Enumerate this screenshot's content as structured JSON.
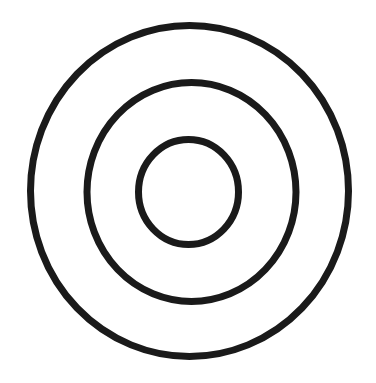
{
  "canvas": {
    "width": 376,
    "height": 383,
    "background": "#ffffff"
  },
  "stroke": {
    "color": "#1a1a1a",
    "width": 7
  },
  "rings": [
    {
      "name": "outer-ring",
      "cx": 189.5,
      "cy": 191,
      "rx": 159,
      "ry": 165.5
    },
    {
      "name": "middle-ring",
      "cx": 191.5,
      "cy": 192,
      "rx": 104.5,
      "ry": 109.5
    },
    {
      "name": "inner-ring",
      "cx": 188.5,
      "cy": 192,
      "rx": 50,
      "ry": 52.5
    }
  ]
}
